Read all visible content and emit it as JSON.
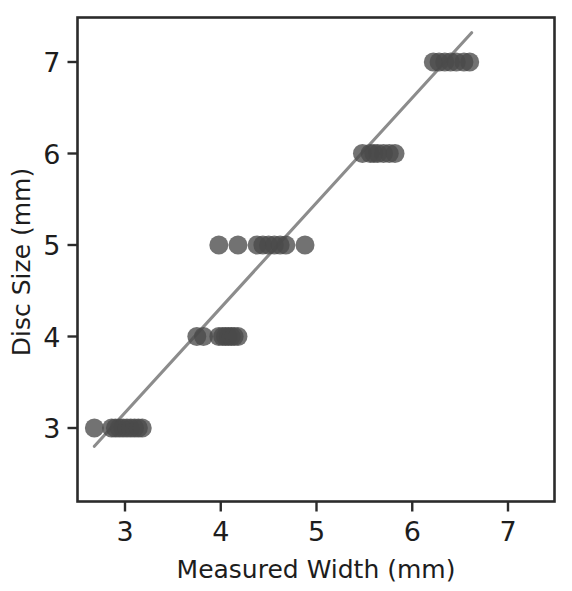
{
  "figure": {
    "width": 572,
    "height": 591,
    "background": "#ffffff"
  },
  "chart_data": {
    "type": "scatter",
    "title": "",
    "xlabel": "Measured Width (mm)",
    "ylabel": "Disc Size (mm)",
    "xlim": [
      2.5,
      7.5
    ],
    "ylim": [
      2.5,
      7.7
    ],
    "xticks": [
      3,
      4,
      5,
      6,
      7
    ],
    "xticklabels": [
      "3",
      "4",
      "5",
      "6",
      "7"
    ],
    "yticks": [
      3,
      4,
      5,
      6,
      7
    ],
    "yticklabels": [
      "3",
      "4",
      "5",
      "6",
      "7"
    ],
    "grid": false,
    "legend": null,
    "marker": {
      "shape": "circle",
      "color": "#4a4a4a",
      "opacity": 0.78,
      "radius_px": 9.5
    },
    "series": [
      {
        "name": "Disc measurements",
        "x": [
          2.68,
          2.86,
          2.9,
          2.94,
          2.98,
          3.02,
          3.06,
          3.1,
          3.14,
          3.18,
          3.75,
          3.82,
          3.98,
          4.02,
          4.05,
          4.08,
          4.11,
          4.14,
          4.18,
          3.98,
          4.18,
          4.38,
          4.44,
          4.5,
          4.56,
          4.62,
          4.68,
          4.88,
          5.48,
          5.56,
          5.6,
          5.64,
          5.7,
          5.76,
          5.82,
          6.22,
          6.28,
          6.34,
          6.4,
          6.46,
          6.54,
          6.6
        ],
        "y": [
          3,
          3,
          3,
          3,
          3,
          3,
          3,
          3,
          3,
          3,
          4,
          4,
          4,
          4,
          4,
          4,
          4,
          4,
          4,
          5,
          5,
          5,
          5,
          5,
          5,
          5,
          5,
          5,
          6,
          6,
          6,
          6,
          6,
          6,
          6,
          7,
          7,
          7,
          7,
          7,
          7,
          7
        ]
      }
    ],
    "fit_line": {
      "name": "linear regression",
      "color": "#8c8c8c",
      "x_start": 2.68,
      "y_start": 2.8,
      "x_end": 6.62,
      "y_end": 7.32
    }
  }
}
